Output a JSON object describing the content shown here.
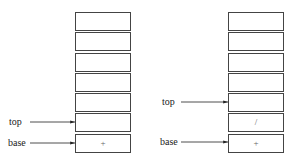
{
  "left_stack": {
    "cells": [
      "",
      "",
      "",
      "",
      "",
      "",
      "+"
    ],
    "top_label": "top",
    "base_label": "base"
  },
  "right_stack": {
    "cells": [
      "",
      "",
      "",
      "",
      "",
      "/",
      "+"
    ],
    "top_label": "top",
    "base_label": "base"
  }
}
